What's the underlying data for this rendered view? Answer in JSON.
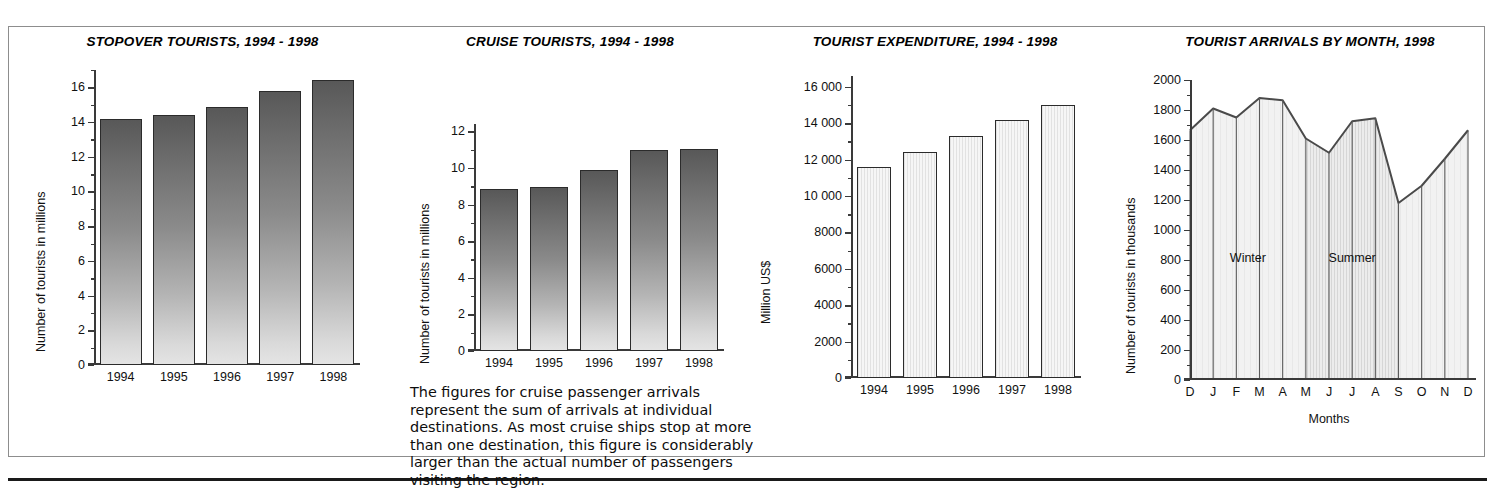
{
  "page": {
    "background": "#ffffff",
    "border_color": "#8d8d8d",
    "rule_color": "#1a1a1a"
  },
  "caption": {
    "text": "The figures for cruise passenger arrivals represent the sum of arrivals at individual destinations. As most cruise ships stop at more than one destination, this figure is considerably larger than the actual number of passengers visiting the region."
  },
  "chart_data": [
    {
      "id": "stopover-tourists",
      "type": "bar",
      "title": "STOPOVER TOURISTS, 1994 - 1998",
      "xlabel": "",
      "ylabel": "Number of tourists in millions",
      "categories": [
        "1994",
        "1995",
        "1996",
        "1997",
        "1998"
      ],
      "values": [
        14.2,
        14.4,
        14.85,
        15.8,
        16.45
      ],
      "ylim": [
        0,
        17
      ],
      "yticks": [
        0,
        2,
        4,
        6,
        8,
        10,
        12,
        14,
        16
      ],
      "yticklabels": [
        "0",
        "2",
        "4",
        "6",
        "8",
        "10",
        "12",
        "14",
        "16"
      ],
      "minor_yticks": [
        1,
        3,
        5,
        7,
        9,
        11,
        13,
        15,
        17
      ],
      "grid": false,
      "bar_style": "vertical-gradient-dark-to-light",
      "bar_color_top": "#585858",
      "bar_color_bottom": "#e4e4e4"
    },
    {
      "id": "cruise-tourists",
      "type": "bar",
      "title": "CRUISE TOURISTS, 1994 - 1998",
      "xlabel": "",
      "ylabel": "Number of tourists in millions",
      "categories": [
        "1994",
        "1995",
        "1996",
        "1997",
        "1998"
      ],
      "values": [
        8.85,
        8.95,
        9.9,
        11.0,
        11.05
      ],
      "ylim": [
        0,
        12.4
      ],
      "yticks": [
        0,
        2,
        4,
        6,
        8,
        10,
        12
      ],
      "yticklabels": [
        "0",
        "2",
        "4",
        "6",
        "8",
        "10",
        "12"
      ],
      "minor_yticks": [
        1,
        3,
        5,
        7,
        9,
        11
      ],
      "grid": false,
      "bar_style": "vertical-gradient-dark-to-light",
      "bar_color_top": "#585858",
      "bar_color_bottom": "#e4e4e4"
    },
    {
      "id": "tourist-expenditure",
      "type": "bar",
      "title": "TOURIST EXPENDITURE, 1994 - 1998",
      "xlabel": "",
      "ylabel": "Million US$",
      "categories": [
        "1994",
        "1995",
        "1996",
        "1997",
        "1998"
      ],
      "values": [
        11600,
        12450,
        13300,
        14200,
        15000
      ],
      "ylim": [
        0,
        16600
      ],
      "yticks": [
        0,
        2000,
        4000,
        6000,
        8000,
        10000,
        12000,
        14000,
        16000
      ],
      "yticklabels": [
        "0",
        "2000",
        "4000",
        "6000",
        "8000",
        "10 000",
        "12 000",
        "14 000",
        "16 000"
      ],
      "minor_yticks": [
        1000,
        3000,
        5000,
        7000,
        9000,
        11000,
        13000,
        15000
      ],
      "grid": false,
      "bar_style": "light-vertical-hatch",
      "bar_color": "#efefef",
      "bar_outline": "#2b2b2b"
    },
    {
      "id": "tourist-arrivals-by-month",
      "type": "area",
      "title": "TOURIST ARRIVALS BY MONTH, 1998",
      "xlabel": "Months",
      "ylabel": "Number of tourists in thousands",
      "x": [
        "D",
        "J",
        "F",
        "M",
        "A",
        "M",
        "J",
        "J",
        "A",
        "S",
        "O",
        "N",
        "D"
      ],
      "values": [
        1665,
        1810,
        1750,
        1880,
        1865,
        1610,
        1515,
        1725,
        1745,
        1180,
        1295,
        1475,
        1665
      ],
      "ylim": [
        0,
        2000
      ],
      "yticks": [
        0,
        200,
        400,
        600,
        800,
        1000,
        1200,
        1400,
        1600,
        1800,
        2000
      ],
      "yticklabels": [
        "0",
        "200",
        "400",
        "600",
        "800",
        "1000",
        "1200",
        "1400",
        "1600",
        "1800",
        "2000"
      ],
      "minor_yticks": [
        100,
        300,
        500,
        700,
        900,
        1100,
        1300,
        1500,
        1700,
        1900
      ],
      "grid": false,
      "annotations": [
        {
          "label": "Winter",
          "x_index": 2.5,
          "y": 800
        },
        {
          "label": "Summer",
          "x_index": 7.0,
          "y": 800
        }
      ],
      "season_shading": [
        {
          "name": "winter",
          "from_index": 0,
          "to_index": 5,
          "fill": "#efefef"
        },
        {
          "name": "summer",
          "from_index": 5,
          "to_index": 9,
          "fill": "#e3e3e3"
        },
        {
          "name": "rest",
          "from_index": 9,
          "to_index": 12,
          "fill": "#ececec"
        }
      ],
      "line_color": "#4a4a4a"
    }
  ]
}
